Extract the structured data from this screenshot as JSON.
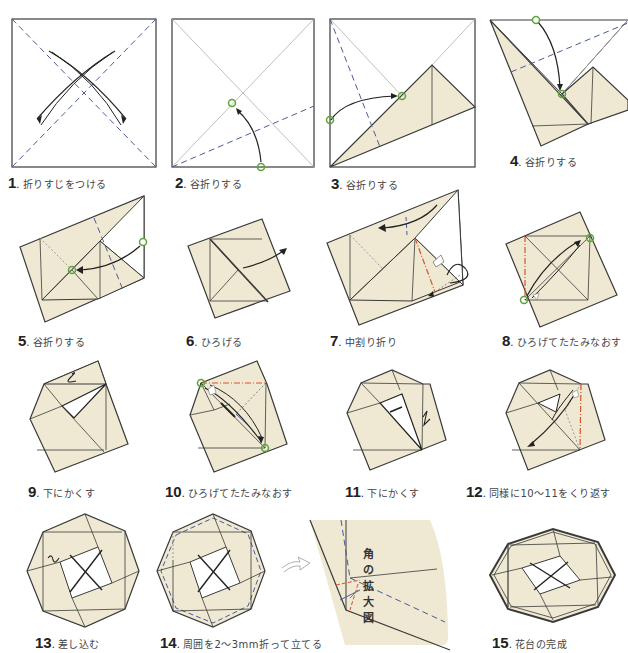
{
  "colors": {
    "paper": "#efe8d3",
    "paper_dark": "#e8dfc5",
    "outline": "#3a3a3a",
    "crease": "#9b9b9b",
    "valley_fold": "#4a5a9a",
    "mountain_fold": "#d9532b",
    "mark": "#5aa53a",
    "arrow": "#222222"
  },
  "steps": [
    {
      "num": "1",
      "text": "折りすじをつける"
    },
    {
      "num": "2",
      "text": "谷折りする"
    },
    {
      "num": "3",
      "text": "谷折りする"
    },
    {
      "num": "4",
      "text": "谷折りする"
    },
    {
      "num": "5",
      "text": "谷折りする"
    },
    {
      "num": "6",
      "text": "ひろげる"
    },
    {
      "num": "7",
      "text": "中割り折り"
    },
    {
      "num": "8",
      "text": "ひろげてたたみなおす"
    },
    {
      "num": "9",
      "text": "下にかくす"
    },
    {
      "num": "10",
      "text": "ひろげてたたみなおす"
    },
    {
      "num": "11",
      "text": "下にかくす"
    },
    {
      "num": "12",
      "text": "同様に10〜11をくり返す"
    },
    {
      "num": "13",
      "text": "差し込む"
    },
    {
      "num": "14",
      "text": "周囲を2〜3mm折って立てる"
    },
    {
      "num": "15",
      "text": "花台の完成"
    }
  ],
  "detail": {
    "label": "角の拡大図"
  }
}
